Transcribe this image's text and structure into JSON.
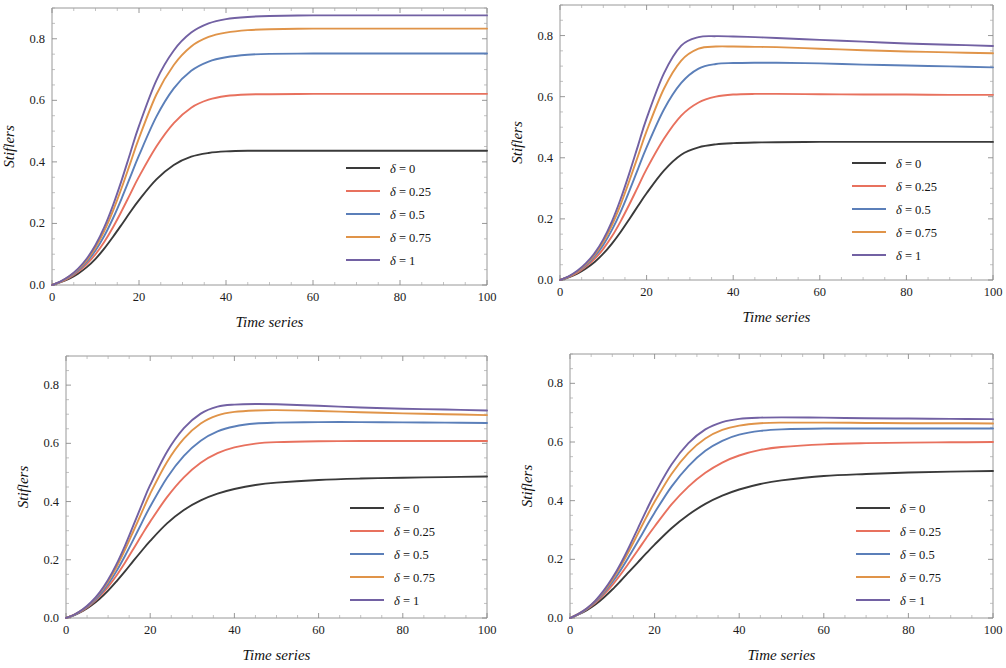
{
  "figure": {
    "panel_count": 4,
    "background": "#ffffff"
  },
  "axes": {
    "xlabel": "Time series",
    "ylabel": "Stiflers",
    "xticks": [
      "0",
      "20",
      "40",
      "60",
      "80",
      "100"
    ],
    "xtick_values": [
      0,
      20,
      40,
      60,
      80,
      100
    ],
    "yticks": [
      "0.0",
      "0.2",
      "0.4",
      "0.6",
      "0.8"
    ],
    "ytick_values": [
      0.0,
      0.2,
      0.4,
      0.6,
      0.8
    ],
    "xlim": [
      0,
      100
    ],
    "ylim": [
      0,
      0.9
    ],
    "grid": false
  },
  "series_colors": {
    "delta_0": "#3a3a3a",
    "delta_025": "#e8715e",
    "delta_05": "#5b7fb9",
    "delta_075": "#e09449",
    "delta_1": "#7261a3"
  },
  "legend": {
    "position": "bottom-right",
    "entries": [
      {
        "label": "δ = 0",
        "symbol": "δ",
        "value": "0",
        "color": "#3a3a3a"
      },
      {
        "label": "δ = 0.25",
        "symbol": "δ",
        "value": "0.25",
        "color": "#e8715e"
      },
      {
        "label": "δ = 0.5",
        "symbol": "δ",
        "value": "0.5",
        "color": "#5b7fb9"
      },
      {
        "label": "δ = 0.75",
        "symbol": "δ",
        "value": "0.75",
        "color": "#e09449"
      },
      {
        "label": "δ = 1",
        "symbol": "δ",
        "value": "1",
        "color": "#7261a3"
      }
    ]
  },
  "chart_data": [
    {
      "type": "line",
      "panel": "top-left",
      "title": "",
      "xlabel": "Time series",
      "ylabel": "Stiflers",
      "xlim": [
        0,
        100
      ],
      "ylim": [
        0,
        0.9
      ],
      "x": [
        0,
        2,
        4,
        6,
        8,
        10,
        12,
        14,
        16,
        18,
        20,
        24,
        28,
        32,
        36,
        40,
        45,
        50,
        60,
        70,
        80,
        90,
        100
      ],
      "series": [
        {
          "name": "δ = 0",
          "color": "#3a3a3a",
          "values": [
            0.0,
            0.009,
            0.021,
            0.037,
            0.058,
            0.085,
            0.118,
            0.156,
            0.196,
            0.237,
            0.276,
            0.343,
            0.39,
            0.417,
            0.429,
            0.434,
            0.436,
            0.436,
            0.436,
            0.436,
            0.436,
            0.436,
            0.436
          ]
        },
        {
          "name": "δ = 0.25",
          "color": "#e8715e",
          "values": [
            0.0,
            0.01,
            0.024,
            0.043,
            0.068,
            0.1,
            0.14,
            0.187,
            0.24,
            0.296,
            0.352,
            0.45,
            0.526,
            0.576,
            0.602,
            0.614,
            0.619,
            0.62,
            0.621,
            0.621,
            0.621,
            0.621,
            0.621
          ]
        },
        {
          "name": "δ = 0.5",
          "color": "#5b7fb9",
          "values": [
            0.0,
            0.011,
            0.026,
            0.047,
            0.075,
            0.112,
            0.159,
            0.216,
            0.281,
            0.351,
            0.421,
            0.547,
            0.639,
            0.696,
            0.726,
            0.74,
            0.748,
            0.751,
            0.752,
            0.752,
            0.752,
            0.752,
            0.752
          ]
        },
        {
          "name": "δ = 0.75",
          "color": "#e09449",
          "values": [
            0.0,
            0.011,
            0.028,
            0.051,
            0.081,
            0.122,
            0.175,
            0.24,
            0.315,
            0.396,
            0.477,
            0.619,
            0.715,
            0.775,
            0.806,
            0.82,
            0.828,
            0.831,
            0.833,
            0.833,
            0.833,
            0.833,
            0.833
          ]
        },
        {
          "name": "δ = 1",
          "color": "#7261a3",
          "values": [
            0.0,
            0.012,
            0.029,
            0.053,
            0.086,
            0.13,
            0.187,
            0.258,
            0.34,
            0.429,
            0.517,
            0.665,
            0.762,
            0.82,
            0.85,
            0.864,
            0.871,
            0.874,
            0.876,
            0.876,
            0.876,
            0.876,
            0.876
          ]
        }
      ],
      "plateaus": [
        0.436,
        0.621,
        0.752,
        0.833,
        0.876
      ]
    },
    {
      "type": "line",
      "panel": "top-right",
      "title": "",
      "xlabel": "Time series",
      "ylabel": "Stiflers",
      "xlim": [
        0,
        100
      ],
      "ylim": [
        0,
        0.9
      ],
      "x": [
        0,
        2,
        4,
        6,
        8,
        10,
        12,
        14,
        16,
        18,
        20,
        24,
        28,
        32,
        36,
        40,
        45,
        50,
        60,
        70,
        80,
        90,
        100
      ],
      "series": [
        {
          "name": "δ = 0",
          "color": "#3a3a3a",
          "values": [
            0.0,
            0.009,
            0.021,
            0.038,
            0.059,
            0.086,
            0.119,
            0.157,
            0.199,
            0.242,
            0.284,
            0.358,
            0.41,
            0.434,
            0.444,
            0.448,
            0.45,
            0.451,
            0.452,
            0.452,
            0.452,
            0.452,
            0.452
          ]
        },
        {
          "name": "δ = 0.25",
          "color": "#e8715e",
          "values": [
            0.0,
            0.01,
            0.024,
            0.044,
            0.069,
            0.102,
            0.143,
            0.192,
            0.247,
            0.305,
            0.363,
            0.462,
            0.538,
            0.581,
            0.6,
            0.607,
            0.609,
            0.609,
            0.608,
            0.607,
            0.607,
            0.606,
            0.606
          ]
        },
        {
          "name": "δ = 0.5",
          "color": "#5b7fb9",
          "values": [
            0.0,
            0.011,
            0.027,
            0.048,
            0.077,
            0.115,
            0.164,
            0.223,
            0.291,
            0.363,
            0.434,
            0.558,
            0.645,
            0.692,
            0.707,
            0.71,
            0.711,
            0.711,
            0.709,
            0.705,
            0.702,
            0.699,
            0.696
          ]
        },
        {
          "name": "δ = 0.75",
          "color": "#e09449",
          "values": [
            0.0,
            0.011,
            0.028,
            0.052,
            0.083,
            0.125,
            0.18,
            0.247,
            0.324,
            0.405,
            0.487,
            0.626,
            0.718,
            0.757,
            0.764,
            0.764,
            0.763,
            0.762,
            0.757,
            0.752,
            0.748,
            0.745,
            0.742
          ]
        },
        {
          "name": "δ = 1",
          "color": "#7261a3",
          "values": [
            0.0,
            0.012,
            0.03,
            0.055,
            0.088,
            0.133,
            0.192,
            0.265,
            0.349,
            0.439,
            0.529,
            0.676,
            0.767,
            0.795,
            0.798,
            0.797,
            0.795,
            0.792,
            0.786,
            0.78,
            0.774,
            0.77,
            0.766
          ]
        }
      ],
      "peaks": [
        0.452,
        0.609,
        0.711,
        0.764,
        0.798
      ],
      "endpoints": [
        0.452,
        0.606,
        0.696,
        0.742,
        0.766
      ]
    },
    {
      "type": "line",
      "panel": "bottom-left",
      "title": "",
      "xlabel": "Time series",
      "ylabel": "Stiflers",
      "xlim": [
        0,
        100
      ],
      "ylim": [
        0,
        0.9
      ],
      "x": [
        0,
        2,
        4,
        6,
        8,
        10,
        12,
        14,
        16,
        18,
        20,
        24,
        28,
        32,
        36,
        40,
        45,
        50,
        60,
        70,
        80,
        90,
        100
      ],
      "series": [
        {
          "name": "δ = 0",
          "color": "#3a3a3a",
          "values": [
            0.0,
            0.01,
            0.024,
            0.043,
            0.066,
            0.094,
            0.126,
            0.16,
            0.196,
            0.231,
            0.265,
            0.325,
            0.371,
            0.404,
            0.427,
            0.443,
            0.457,
            0.465,
            0.474,
            0.479,
            0.482,
            0.484,
            0.486
          ]
        },
        {
          "name": "δ = 0.25",
          "color": "#e8715e",
          "values": [
            0.0,
            0.011,
            0.026,
            0.047,
            0.074,
            0.107,
            0.146,
            0.19,
            0.237,
            0.285,
            0.331,
            0.415,
            0.483,
            0.533,
            0.566,
            0.586,
            0.599,
            0.604,
            0.607,
            0.608,
            0.608,
            0.608,
            0.608
          ]
        },
        {
          "name": "δ = 0.5",
          "color": "#5b7fb9",
          "values": [
            0.0,
            0.011,
            0.028,
            0.05,
            0.079,
            0.116,
            0.161,
            0.213,
            0.269,
            0.327,
            0.383,
            0.482,
            0.557,
            0.609,
            0.641,
            0.658,
            0.668,
            0.671,
            0.673,
            0.673,
            0.672,
            0.671,
            0.67
          ]
        },
        {
          "name": "δ = 0.75",
          "color": "#e09449",
          "values": [
            0.0,
            0.012,
            0.029,
            0.053,
            0.085,
            0.125,
            0.175,
            0.234,
            0.298,
            0.363,
            0.427,
            0.536,
            0.616,
            0.668,
            0.696,
            0.708,
            0.713,
            0.714,
            0.711,
            0.707,
            0.703,
            0.7,
            0.697
          ]
        },
        {
          "name": "δ = 1",
          "color": "#7261a3",
          "values": [
            0.0,
            0.012,
            0.03,
            0.055,
            0.088,
            0.131,
            0.185,
            0.248,
            0.318,
            0.389,
            0.457,
            0.571,
            0.652,
            0.702,
            0.726,
            0.733,
            0.735,
            0.734,
            0.729,
            0.723,
            0.719,
            0.716,
            0.713
          ]
        }
      ],
      "peaks": [
        0.486,
        0.608,
        0.673,
        0.714,
        0.735
      ],
      "endpoints": [
        0.486,
        0.608,
        0.67,
        0.697,
        0.713
      ]
    },
    {
      "type": "line",
      "panel": "bottom-right",
      "title": "",
      "xlabel": "Time series",
      "ylabel": "Stiflers",
      "xlim": [
        0,
        100
      ],
      "ylim": [
        0,
        0.9
      ],
      "x": [
        0,
        2,
        4,
        6,
        8,
        10,
        12,
        14,
        16,
        18,
        20,
        24,
        28,
        32,
        36,
        40,
        45,
        50,
        60,
        70,
        80,
        90,
        100
      ],
      "series": [
        {
          "name": "δ = 0",
          "color": "#3a3a3a",
          "values": [
            0.0,
            0.012,
            0.027,
            0.046,
            0.07,
            0.097,
            0.127,
            0.158,
            0.189,
            0.22,
            0.25,
            0.306,
            0.352,
            0.389,
            0.417,
            0.438,
            0.457,
            0.469,
            0.484,
            0.491,
            0.496,
            0.499,
            0.501
          ]
        },
        {
          "name": "δ = 0.25",
          "color": "#e8715e",
          "values": [
            0.0,
            0.013,
            0.03,
            0.052,
            0.08,
            0.112,
            0.149,
            0.189,
            0.23,
            0.272,
            0.312,
            0.387,
            0.448,
            0.495,
            0.53,
            0.554,
            0.573,
            0.583,
            0.592,
            0.596,
            0.598,
            0.599,
            0.6
          ]
        },
        {
          "name": "δ = 0.5",
          "color": "#5b7fb9",
          "values": [
            0.0,
            0.013,
            0.031,
            0.055,
            0.086,
            0.122,
            0.164,
            0.211,
            0.26,
            0.31,
            0.359,
            0.448,
            0.518,
            0.57,
            0.604,
            0.625,
            0.638,
            0.643,
            0.646,
            0.646,
            0.646,
            0.646,
            0.646
          ]
        },
        {
          "name": "δ = 0.75",
          "color": "#e09449",
          "values": [
            0.0,
            0.014,
            0.032,
            0.058,
            0.091,
            0.13,
            0.177,
            0.23,
            0.286,
            0.342,
            0.396,
            0.491,
            0.563,
            0.612,
            0.641,
            0.656,
            0.664,
            0.666,
            0.666,
            0.665,
            0.664,
            0.664,
            0.663
          ]
        },
        {
          "name": "δ = 1",
          "color": "#7261a3",
          "values": [
            0.0,
            0.014,
            0.033,
            0.059,
            0.094,
            0.136,
            0.186,
            0.243,
            0.304,
            0.365,
            0.423,
            0.523,
            0.596,
            0.643,
            0.668,
            0.679,
            0.683,
            0.684,
            0.683,
            0.681,
            0.68,
            0.679,
            0.678
          ]
        }
      ],
      "peaks": [
        0.501,
        0.6,
        0.646,
        0.666,
        0.684
      ],
      "endpoints": [
        0.501,
        0.6,
        0.646,
        0.663,
        0.678
      ]
    }
  ]
}
